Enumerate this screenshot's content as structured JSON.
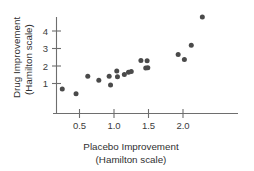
{
  "chart_data": {
    "type": "scatter",
    "title": "",
    "xlabel": "Placebo Improvement (Hamilton scale)",
    "ylabel": "Drug Improvement (Hamilton scale)",
    "xlabel_line1": "Placebo Improvement",
    "xlabel_line2": "(Hamilton scale)",
    "ylabel_line1": "Drug Improvement",
    "ylabel_line2": "(Hamilton scale)",
    "xlim": [
      0.0,
      2.65
    ],
    "ylim": [
      0.0,
      5.1
    ],
    "xticks": [
      0.5,
      1.0,
      1.5,
      2.0
    ],
    "xtick_labels": [
      "0.5",
      "1.0",
      "1.5",
      "2.0"
    ],
    "yticks": [
      1,
      2,
      3,
      4
    ],
    "ytick_labels": [
      "1",
      "2",
      "3",
      "4"
    ],
    "grid": false,
    "legend": null,
    "marker": "filled-circle",
    "marker_color": "#4a4a4a",
    "points": [
      {
        "x": 0.25,
        "y": 0.68
      },
      {
        "x": 0.45,
        "y": 0.42
      },
      {
        "x": 0.62,
        "y": 1.42
      },
      {
        "x": 0.78,
        "y": 1.18
      },
      {
        "x": 0.93,
        "y": 1.42
      },
      {
        "x": 0.95,
        "y": 0.92
      },
      {
        "x": 1.04,
        "y": 1.72
      },
      {
        "x": 1.05,
        "y": 1.38
      },
      {
        "x": 1.15,
        "y": 1.52
      },
      {
        "x": 1.21,
        "y": 1.65
      },
      {
        "x": 1.25,
        "y": 1.68
      },
      {
        "x": 1.39,
        "y": 2.32
      },
      {
        "x": 1.48,
        "y": 2.3
      },
      {
        "x": 1.46,
        "y": 1.88
      },
      {
        "x": 1.49,
        "y": 1.9
      },
      {
        "x": 1.93,
        "y": 2.66
      },
      {
        "x": 2.02,
        "y": 2.37
      },
      {
        "x": 2.12,
        "y": 3.18
      },
      {
        "x": 2.28,
        "y": 4.8
      }
    ]
  },
  "axes": {
    "x_axis_name": "placebo-improvement-axis",
    "y_axis_name": "drug-improvement-axis"
  }
}
